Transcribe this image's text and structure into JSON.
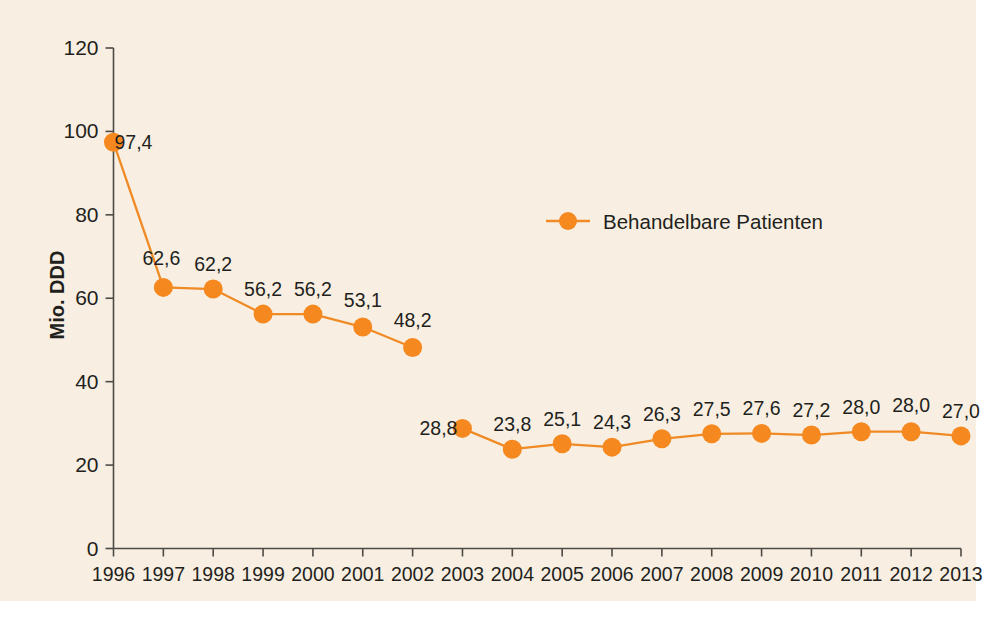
{
  "figure": {
    "background_color": "#f8efe2",
    "page_color": "#ffffff"
  },
  "chart_data": {
    "type": "line",
    "title": "",
    "subtitle": "",
    "xlabel": "",
    "ylabel": "Mio. DDD",
    "categories": [
      "1996",
      "1997",
      "1998",
      "1999",
      "2000",
      "2001",
      "2002",
      "2003",
      "2004",
      "2005",
      "2006",
      "2007",
      "2008",
      "2009",
      "2010",
      "2011",
      "2012",
      "2013"
    ],
    "values": [
      97.4,
      62.6,
      62.2,
      56.2,
      56.2,
      53.1,
      48.2,
      28.8,
      23.8,
      25.1,
      24.3,
      26.3,
      27.5,
      27.6,
      27.2,
      28.0,
      28.0,
      27.0
    ],
    "point_labels": [
      "97,4",
      "62,6",
      "62,2",
      "56,2",
      "56,2",
      "53,1",
      "48,2",
      "28,8",
      "23,8",
      "25,1",
      "24,3",
      "26,3",
      "27,5",
      "27,6",
      "27,2",
      "28,0",
      "28,0",
      "27,0"
    ],
    "series": [
      {
        "name": "Behandelbare Patienten",
        "color": "#f5881f",
        "values": [
          97.4,
          62.6,
          62.2,
          56.2,
          56.2,
          53.1,
          48.2,
          28.8,
          23.8,
          25.1,
          24.3,
          26.3,
          27.5,
          27.6,
          27.2,
          28.0,
          28.0,
          27.0
        ],
        "line_break_after_index": 6
      }
    ],
    "ylim": [
      0,
      120
    ],
    "yticks": [
      0,
      20,
      40,
      60,
      80,
      100,
      120
    ],
    "ytick_labels": [
      "0",
      "20",
      "40",
      "60",
      "80",
      "100",
      "120"
    ],
    "grid": false,
    "legend_position": "inside-upper-center"
  },
  "legend": {
    "entries": [
      {
        "label": "Behandelbare Patienten",
        "color": "#f5881f",
        "marker": "circle"
      }
    ]
  },
  "axis": {
    "y_title": "Mio. DDD",
    "line_color": "#4d4a46"
  }
}
